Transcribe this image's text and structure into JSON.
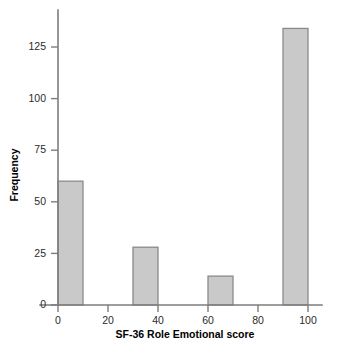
{
  "chart_data": {
    "type": "bar",
    "title": "",
    "subtitle": "",
    "xlabel": "SF-36 Role Emotional score",
    "ylabel": "Frequency",
    "categories": [
      "0-10",
      "30-40",
      "60-70",
      "90-100"
    ],
    "values": [
      60,
      28,
      14,
      134
    ],
    "bin_starts": [
      0,
      30,
      60,
      90
    ],
    "bin_width": 10,
    "xlim": [
      -7,
      108
    ],
    "ylim": [
      0,
      140
    ],
    "xticks": [
      0,
      20,
      40,
      60,
      80,
      100
    ],
    "xtick_labels": [
      "0",
      "20",
      "40",
      "60",
      "80",
      "100"
    ],
    "yticks": [
      0,
      25,
      50,
      75,
      100,
      125
    ],
    "ytick_labels": [
      "0",
      "25",
      "50",
      "75",
      "100",
      "125"
    ],
    "grid": false,
    "legend": false,
    "legend_position": "none",
    "bar_fill_color": "#c9c9c9",
    "bar_edge_color": "#8a8a8a",
    "axis_color": "#7d7d7d",
    "text_color": "#000000",
    "background_color": "#ffffff",
    "series": [
      {
        "name": "Frequency",
        "values": [
          60,
          28,
          14,
          134
        ]
      }
    ]
  }
}
